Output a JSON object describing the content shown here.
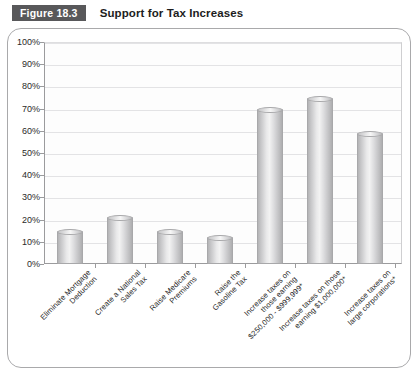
{
  "header": {
    "badge": "Figure 18.3",
    "title": "Support for Tax Increases"
  },
  "chart_data": {
    "type": "bar",
    "title": "Support for Tax Increases",
    "xlabel": "",
    "ylabel": "",
    "ylim": [
      0,
      100
    ],
    "ytick_labels": [
      "100%",
      "90%",
      "80%",
      "70%",
      "60%",
      "50%",
      "40%",
      "30%",
      "20%",
      "10%",
      "0%"
    ],
    "ytick_values": [
      100,
      90,
      80,
      70,
      60,
      50,
      40,
      30,
      20,
      10,
      0
    ],
    "grid": true,
    "legend": "none",
    "categories": [
      "Eliminate Mortgage\nDeduction",
      "Create a National\nSales Tax",
      "Raise Medicare\nPremiums",
      "Raise the\nGasoline Tax",
      "Increase taxes on\nthose earning\n$250,000 - $999,999*",
      "Increase taxes on those\nearning $1,000,000*",
      "Increase taxes on\nlarge corporations*"
    ],
    "values": [
      15,
      21,
      15,
      12,
      70,
      75,
      59
    ]
  }
}
